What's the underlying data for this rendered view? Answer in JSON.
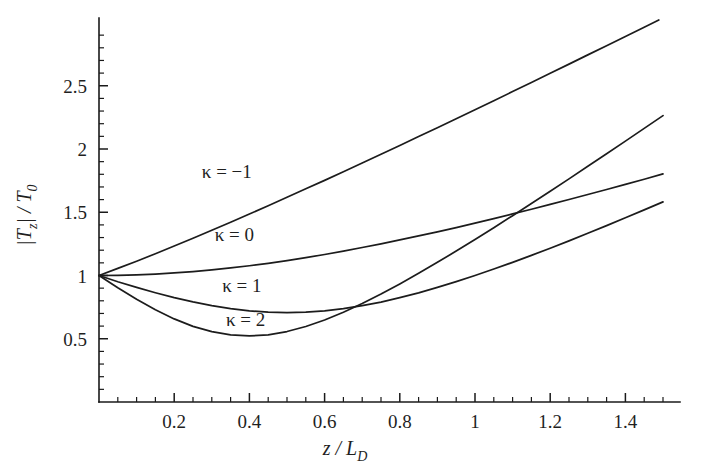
{
  "figure": {
    "background_color": "#ffffff",
    "line_color": "#1c1c1c",
    "axis_color": "#1a1a1a"
  },
  "axes": {
    "x_title": "z / L",
    "x_title_sub": "D",
    "y_title_pre": "|T",
    "y_title_sub1": "z",
    "y_title_mid": "| / T",
    "y_title_sub2": "0",
    "x_ticks": [
      "0.2",
      "0.4",
      "0.6",
      "0.8",
      "1",
      "1.2",
      "1.4"
    ],
    "x_tick_values": [
      0.2,
      0.4,
      0.6,
      0.8,
      1.0,
      1.2,
      1.4
    ],
    "y_ticks": [
      "0.5",
      "1",
      "1.5",
      "2",
      "2.5"
    ],
    "y_tick_values": [
      0.5,
      1.0,
      1.5,
      2.0,
      2.5
    ],
    "x_minor_step": 0.05,
    "y_minor_step": 0.1
  },
  "curve_labels": [
    {
      "text": "κ = −1",
      "x": 0.34,
      "y": 1.77
    },
    {
      "text": "κ = 0",
      "x": 0.36,
      "y": 1.27
    },
    {
      "text": "κ = 1",
      "x": 0.38,
      "y": 0.87
    },
    {
      "text": "κ = 2",
      "x": 0.39,
      "y": 0.6
    }
  ],
  "chart_data": {
    "type": "line",
    "title": "",
    "xlabel": "z / L_D",
    "ylabel": "|T_z| / T_0",
    "xlim": [
      0,
      1.53
    ],
    "ylim": [
      0,
      2.92
    ],
    "grid": false,
    "legend_position": "inline-annotations",
    "x": [
      0.0,
      0.05,
      0.1,
      0.15,
      0.2,
      0.25,
      0.3,
      0.35,
      0.4,
      0.45,
      0.5,
      0.55,
      0.6,
      0.65,
      0.7,
      0.75,
      0.8,
      0.85,
      0.9,
      0.95,
      1.0,
      1.05,
      1.1,
      1.15,
      1.2,
      1.25,
      1.3,
      1.35,
      1.4,
      1.45,
      1.5
    ],
    "series": [
      {
        "name": "κ = −1",
        "kappa": -1,
        "values": [
          1.0,
          1.056,
          1.113,
          1.172,
          1.233,
          1.295,
          1.358,
          1.421,
          1.486,
          1.551,
          1.618,
          1.685,
          1.752,
          1.82,
          1.889,
          1.958,
          2.028,
          2.098,
          2.168,
          2.239,
          2.31,
          2.382,
          2.454,
          2.526,
          2.598,
          2.671,
          2.744,
          2.817,
          2.89,
          2.963,
          3.036
        ]
      },
      {
        "name": "κ = 0",
        "kappa": 0,
        "values": [
          1.0,
          1.001,
          1.005,
          1.011,
          1.02,
          1.031,
          1.044,
          1.06,
          1.077,
          1.096,
          1.118,
          1.141,
          1.166,
          1.192,
          1.221,
          1.25,
          1.281,
          1.313,
          1.345,
          1.379,
          1.414,
          1.45,
          1.487,
          1.524,
          1.562,
          1.601,
          1.64,
          1.68,
          1.72,
          1.761,
          1.803
        ]
      },
      {
        "name": "κ = 1",
        "kappa": 1,
        "values": [
          1.0,
          0.951,
          0.906,
          0.864,
          0.825,
          0.791,
          0.762,
          0.738,
          0.721,
          0.71,
          0.707,
          0.711,
          0.721,
          0.738,
          0.762,
          0.79,
          0.825,
          0.863,
          0.906,
          0.952,
          1.0,
          1.051,
          1.104,
          1.159,
          1.216,
          1.274,
          1.334,
          1.394,
          1.456,
          1.519,
          1.582
        ]
      },
      {
        "name": "κ = 2",
        "kappa": 2,
        "values": [
          1.0,
          0.903,
          0.812,
          0.729,
          0.657,
          0.598,
          0.556,
          0.53,
          0.522,
          0.531,
          0.557,
          0.597,
          0.648,
          0.709,
          0.778,
          0.853,
          0.933,
          1.017,
          1.104,
          1.193,
          1.285,
          1.378,
          1.473,
          1.569,
          1.666,
          1.764,
          1.863,
          1.962,
          2.062,
          2.163,
          2.264
        ]
      }
    ]
  }
}
